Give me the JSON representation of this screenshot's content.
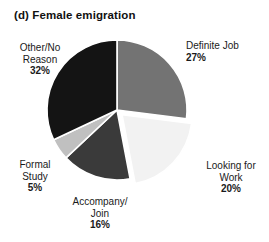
{
  "chart_data": {
    "type": "pie",
    "title": "(d) Female emigration",
    "xlabel": "",
    "ylabel": "",
    "legend": "none",
    "grid": false,
    "start_angle_deg": 0,
    "direction": "clockwise",
    "categories": [
      "Definite Job",
      "Looking for Work",
      "Accompany/ Join",
      "Formal Study",
      "Other/No Reason"
    ],
    "values": [
      27,
      20,
      16,
      5,
      32
    ],
    "value_unit": "%",
    "colors": [
      "#737373",
      "#f2f2f2",
      "#3a3a3a",
      "#c0c0c0",
      "#141414"
    ],
    "exploded": [
      false,
      true,
      false,
      false,
      false
    ],
    "slices": [
      {
        "name": "Definite Job",
        "label_line1": "Definite Job",
        "label_line2": "",
        "percent_label": "27%",
        "value": 27,
        "color": "#737373",
        "exploded": false
      },
      {
        "name": "Looking for Work",
        "label_line1": "Looking for",
        "label_line2": "Work",
        "percent_label": "20%",
        "value": 20,
        "color": "#f2f2f2",
        "exploded": true
      },
      {
        "name": "Accompany/ Join",
        "label_line1": "Accompany/",
        "label_line2": "Join",
        "percent_label": "16%",
        "value": 16,
        "color": "#3a3a3a",
        "exploded": false
      },
      {
        "name": "Formal Study",
        "label_line1": "Formal",
        "label_line2": "Study",
        "percent_label": "5%",
        "value": 5,
        "color": "#c0c0c0",
        "exploded": false
      },
      {
        "name": "Other/No Reason",
        "label_line1": "Other/No",
        "label_line2": "Reason",
        "percent_label": "32%",
        "value": 32,
        "color": "#141414",
        "exploded": false
      }
    ]
  },
  "geometry": {
    "center_x": 117,
    "center_y": 110,
    "radius": 70
  }
}
